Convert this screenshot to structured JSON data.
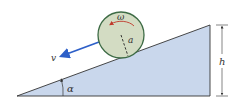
{
  "diagram": {
    "type": "physics-incline",
    "labels": {
      "omega": "ω",
      "radius": "a",
      "velocity": "v",
      "height": "h",
      "angle": "α"
    },
    "colors": {
      "incline_fill": "#c9d7ec",
      "incline_stroke": "#333333",
      "disk_fill": "#d3dcc3",
      "disk_stroke": "#3d6b45",
      "rotation_arrow": "#c0392b",
      "velocity_arrow": "#2d5fc8",
      "dimension_line": "#333333"
    }
  }
}
